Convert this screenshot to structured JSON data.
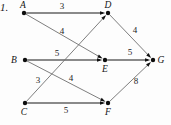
{
  "problem": {
    "number": "1."
  },
  "colors": {
    "edge": "#6f6f6f",
    "edge_thick": "#8a8a8a",
    "node": "#0d0d0d",
    "text": "#141414",
    "background": "#fdfdfd"
  },
  "graph": {
    "type": "directed-weighted-graph",
    "nodes": [
      {
        "id": "A",
        "label": "A",
        "x": 24,
        "y": 13,
        "label_dx": -1,
        "label_dy": -5
      },
      {
        "id": "D",
        "label": "D",
        "x": 108,
        "y": 13,
        "label_dx": 0,
        "label_dy": -5
      },
      {
        "id": "B",
        "label": "B",
        "x": 25,
        "y": 60,
        "label_dx": -11,
        "label_dy": 3
      },
      {
        "id": "E",
        "label": "E",
        "x": 105,
        "y": 60,
        "label_dx": 0,
        "label_dy": 12
      },
      {
        "id": "G",
        "label": "G",
        "x": 153,
        "y": 60,
        "label_dx": 8,
        "label_dy": 3
      },
      {
        "id": "C",
        "label": "C",
        "x": 25,
        "y": 103,
        "label_dx": -1,
        "label_dy": 12
      },
      {
        "id": "F",
        "label": "F",
        "x": 108,
        "y": 103,
        "label_dx": 0,
        "label_dy": 12
      }
    ],
    "edges": [
      {
        "from": "A",
        "to": "D",
        "weight": "3",
        "style": "thick",
        "lx": 62,
        "ly": 9
      },
      {
        "from": "A",
        "to": "E",
        "weight": "4",
        "style": "thin",
        "lx": 62,
        "ly": 34
      },
      {
        "from": "B",
        "to": "E",
        "weight": "5",
        "style": "thick",
        "lx": 57,
        "ly": 56
      },
      {
        "from": "B",
        "to": "F",
        "weight": "4",
        "style": "thin",
        "lx": 71,
        "ly": 81
      },
      {
        "from": "C",
        "to": "D",
        "weight": "3",
        "style": "thin",
        "lx": 38,
        "ly": 83
      },
      {
        "from": "C",
        "to": "F",
        "weight": "5",
        "style": "thick",
        "lx": 66,
        "ly": 113
      },
      {
        "from": "D",
        "to": "G",
        "weight": "4",
        "style": "thin",
        "lx": 135,
        "ly": 33
      },
      {
        "from": "E",
        "to": "G",
        "weight": "5",
        "style": "thick",
        "lx": 130,
        "ly": 55
      },
      {
        "from": "F",
        "to": "G",
        "weight": "8",
        "style": "thin",
        "lx": 136,
        "ly": 84
      }
    ]
  }
}
